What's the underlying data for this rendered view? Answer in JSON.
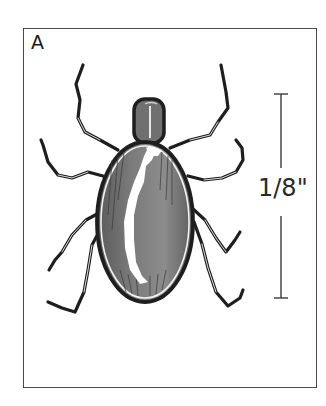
{
  "figure": {
    "panel_label": "A",
    "scale_bar": {
      "label": "1/8\"",
      "orientation": "vertical"
    }
  },
  "colors": {
    "frame": "#4a4a4a",
    "outline": "#1e1e1e",
    "body_fill": "#6e6e6e",
    "body_mid": "#8a8a8a",
    "highlight": "#ffffff",
    "scale_bar": "#3a3a3a"
  }
}
